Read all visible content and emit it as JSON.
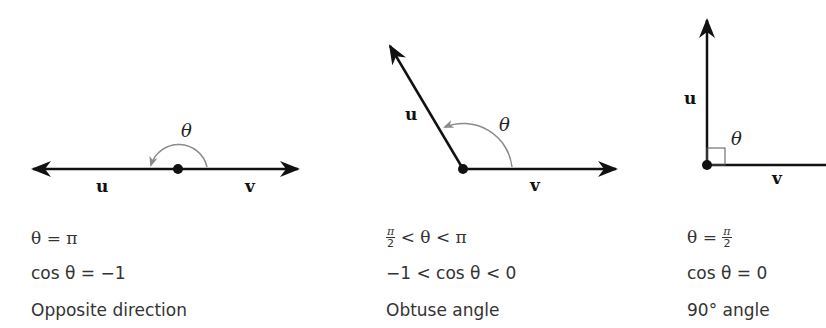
{
  "panels": [
    {
      "id": "opposite",
      "vector_u": "u",
      "vector_v": "v",
      "angle_symbol": "θ",
      "line1": "θ = π",
      "line2": "cos θ = −1",
      "description": "Opposite direction"
    },
    {
      "id": "obtuse",
      "vector_u": "u",
      "vector_v": "v",
      "angle_symbol": "θ",
      "line1_parts": {
        "frac_num": "π",
        "frac_den": "2",
        "rest": "< θ < π"
      },
      "line1": "π/2 < θ < π",
      "line2": "−1 < cos θ < 0",
      "description": "Obtuse angle"
    },
    {
      "id": "right",
      "vector_u": "u",
      "vector_v": "v",
      "angle_symbol": "θ",
      "line1_parts": {
        "prefix": "θ =",
        "frac_num": "π",
        "frac_den": "2"
      },
      "line1": "θ = π/2",
      "line2": "cos θ = 0",
      "description": "90° angle"
    }
  ],
  "colors": {
    "vector": "#111111",
    "arc": "#8a8a8a",
    "text": "#333333"
  }
}
